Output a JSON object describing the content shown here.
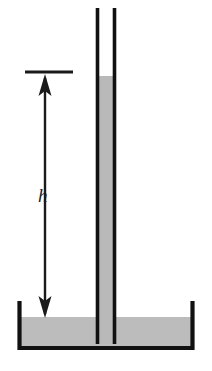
{
  "figure": {
    "canvas": {
      "width": 212,
      "height": 371
    },
    "background_color": "#ffffff"
  },
  "colors": {
    "outline": "#111111",
    "liquid_fill": "#bcbcbc",
    "liquid_fill_tube": "#b9b9b9",
    "arrow": "#1a1a1a",
    "label_text": "#1a1a1a"
  },
  "labels": {
    "height_symbol": "h"
  },
  "chart_data": {
    "type": "diagram",
    "annotations": [
      {
        "name": "capillary-rise-height",
        "symbol": "h",
        "from_y": 72,
        "to_y": 318
      }
    ],
    "elements": [
      {
        "name": "container",
        "shape": "open-top-rectangle",
        "left_x": 18,
        "right_x": 194,
        "top_y": 303,
        "bottom_y": 350,
        "stroke_width": 4
      },
      {
        "name": "reservoir-liquid",
        "shape": "rect",
        "left_x": 20,
        "right_x": 192,
        "surface_y": 317,
        "bottom_y": 347
      },
      {
        "name": "capillary-tube-left-wall",
        "shape": "vline",
        "x": 97.5,
        "top_y": 8,
        "bottom_y": 344,
        "stroke_width": 3.5
      },
      {
        "name": "capillary-tube-right-wall",
        "shape": "vline",
        "x": 114.5,
        "top_y": 8,
        "bottom_y": 344,
        "stroke_width": 3.5
      },
      {
        "name": "tube-liquid-column",
        "shape": "rect",
        "left_x": 99,
        "right_x": 113,
        "meniscus_top_y": 68,
        "meniscus_bottom_y": 76,
        "bottom_y": 344
      },
      {
        "name": "level-tick-line",
        "shape": "hline",
        "y": 72,
        "from_x": 25,
        "to_x": 73,
        "stroke_width": 3
      },
      {
        "name": "dimension-arrow",
        "shape": "double-headed-vertical-arrow",
        "x": 45,
        "top_y": 74,
        "bottom_y": 318,
        "stroke_width": 2.4,
        "head_width": 13,
        "head_length": 22
      }
    ],
    "axis_ranges": {
      "x": [
        0,
        212
      ],
      "y": [
        0,
        371
      ]
    },
    "grid": false,
    "legend": null
  }
}
